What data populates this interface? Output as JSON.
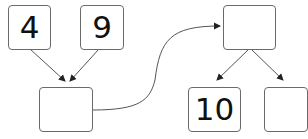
{
  "diagram": {
    "type": "number-bond-flow",
    "boxes": [
      {
        "id": "top-left",
        "value": "4"
      },
      {
        "id": "top-middle",
        "value": "9"
      },
      {
        "id": "sum",
        "value": ""
      },
      {
        "id": "top-right",
        "value": ""
      },
      {
        "id": "bottom-middle",
        "value": "10"
      },
      {
        "id": "bottom-right",
        "value": ""
      }
    ],
    "connections": [
      {
        "from": "top-left",
        "to": "sum"
      },
      {
        "from": "top-middle",
        "to": "sum"
      },
      {
        "from": "sum",
        "to": "top-right"
      },
      {
        "from": "top-right",
        "to": "bottom-middle"
      },
      {
        "from": "top-right",
        "to": "bottom-right"
      }
    ],
    "colors": {
      "stroke": "#6a6a6a",
      "arrow": "#222222",
      "text": "#111111"
    }
  }
}
